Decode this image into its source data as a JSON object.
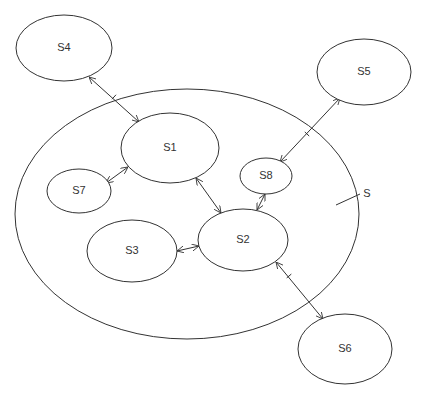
{
  "diagram": {
    "system": {
      "label": "S",
      "cx": 187,
      "cy": 214,
      "rx": 172,
      "ry": 125,
      "label_x": 367,
      "label_y": 194
    },
    "nodes": [
      {
        "id": "S1",
        "label": "S1",
        "cx": 170,
        "cy": 148,
        "rx": 49,
        "ry": 35
      },
      {
        "id": "S2",
        "label": "S2",
        "cx": 243,
        "cy": 240,
        "rx": 45,
        "ry": 31
      },
      {
        "id": "S3",
        "label": "S3",
        "cx": 132,
        "cy": 251,
        "rx": 45,
        "ry": 31
      },
      {
        "id": "S4",
        "label": "S4",
        "cx": 64,
        "cy": 48,
        "rx": 48,
        "ry": 33
      },
      {
        "id": "S5",
        "label": "S5",
        "cx": 364,
        "cy": 72,
        "rx": 47,
        "ry": 33
      },
      {
        "id": "S6",
        "label": "S6",
        "cx": 345,
        "cy": 349,
        "rx": 47,
        "ry": 35
      },
      {
        "id": "S7",
        "label": "S7",
        "cx": 79,
        "cy": 191,
        "rx": 32,
        "ry": 22
      },
      {
        "id": "S8",
        "label": "S8",
        "cx": 266,
        "cy": 176,
        "rx": 26,
        "ry": 18
      }
    ],
    "edges": [
      {
        "from": "S4",
        "to": "S1",
        "x1": 89,
        "y1": 77,
        "x2": 139,
        "y2": 122,
        "via": [
          114,
          97
        ]
      },
      {
        "from": "S1",
        "to": "S7",
        "x1": 128,
        "y1": 167,
        "x2": 106,
        "y2": 183
      },
      {
        "from": "S1",
        "to": "S2",
        "x1": 196,
        "y1": 178,
        "x2": 221,
        "y2": 213
      },
      {
        "from": "S5",
        "to": "S8",
        "x1": 340,
        "y1": 98,
        "x2": 280,
        "y2": 162,
        "via": [
          307,
          134
        ]
      },
      {
        "from": "S8",
        "to": "S2",
        "x1": 265,
        "y1": 194,
        "x2": 257,
        "y2": 210
      },
      {
        "from": "S2",
        "to": "S3",
        "x1": 199,
        "y1": 246,
        "x2": 177,
        "y2": 251
      },
      {
        "from": "S2",
        "to": "S6",
        "x1": 276,
        "y1": 262,
        "x2": 323,
        "y2": 319,
        "via": [
          289,
          276
        ]
      }
    ],
    "system_label_leader": {
      "x1": 336,
      "y1": 205,
      "x2": 360,
      "y2": 194
    }
  }
}
